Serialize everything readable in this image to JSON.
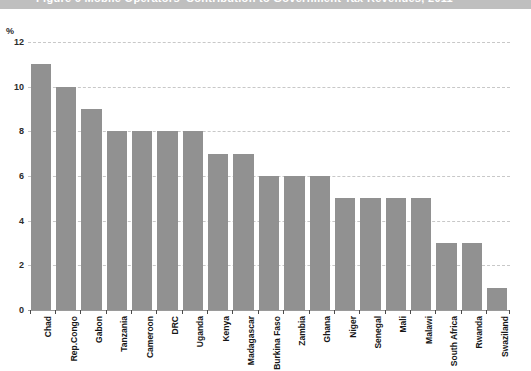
{
  "figure": {
    "title": "Figure 6   Mobile Operators' Contribution to Government Tax Revenues, 2011",
    "unit_label": "%"
  },
  "chart_data": {
    "type": "bar",
    "title": "Figure 6   Mobile Operators' Contribution to Government Tax Revenues, 2011",
    "xlabel": "",
    "ylabel": "%",
    "ylim": [
      0,
      12
    ],
    "yticks": [
      0,
      2,
      4,
      6,
      8,
      10,
      12
    ],
    "grid": true,
    "legend": "none",
    "bar_color": "#919191",
    "gridline_color": "#c8c8c8",
    "categories": [
      "Chad",
      "Rep.Congo",
      "Gabon",
      "Tanzania",
      "Cameroon",
      "DRC",
      "Uganda",
      "Kenya",
      "Madagascar",
      "Burkina Faso",
      "Zambia",
      "Ghana",
      "Niger",
      "Senegal",
      "Mali",
      "Malawi",
      "South Africa",
      "Rwanda",
      "Swaziland"
    ],
    "values": [
      11,
      10,
      9,
      8,
      8,
      8,
      8,
      7,
      7,
      6,
      6,
      6,
      5,
      5,
      5,
      5,
      3,
      3,
      1
    ]
  }
}
